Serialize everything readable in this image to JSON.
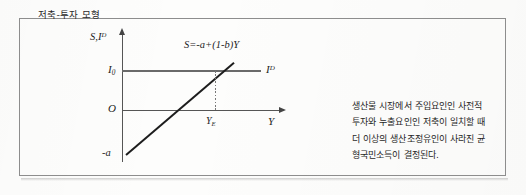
{
  "figure": {
    "caption": "저축-투자 모형"
  },
  "chart_data": {
    "type": "line",
    "title": "저축-투자 모형",
    "xlabel": "Y",
    "ylabel": "S,I",
    "ylabel_full": "S,I D",
    "grid": false,
    "legend": "inline-labels",
    "axis_labels": {
      "y_axis": "S,I",
      "y_axis_superscript": "D",
      "x_axis": "Y",
      "origin": "O"
    },
    "tick_labels": {
      "y_investment": "I",
      "y_investment_subscript": "0",
      "x_equilibrium": "Y",
      "x_equilibrium_subscript": "E",
      "y_intercept": "-a"
    },
    "series": [
      {
        "name": "S=-a+(1-b)Y",
        "label": "S=-a+(1-b)Y",
        "type": "line",
        "style": "solid-black",
        "description": "Saving function, upward sloping, intercept -a",
        "points": [
          [
            0,
            -1
          ],
          [
            1,
            1.6
          ]
        ]
      },
      {
        "name": "I",
        "label": "I",
        "label_superscript": "D",
        "type": "line",
        "style": "solid-grey-horizontal",
        "description": "Autonomous investment demand, horizontal at I0",
        "points": [
          [
            0,
            0.5
          ],
          [
            1,
            0.5
          ]
        ]
      }
    ],
    "annotations": [
      {
        "name": "equilibrium-drop-line",
        "style": "dotted",
        "description": "Vertical dotted line from S and I intersection down to YE on the horizontal axis"
      }
    ]
  },
  "note": {
    "lines": [
      "생산물 시장에서 주입요인인 사전적",
      "투자와 누출요인인 저축이 일치할 때",
      "더 이상의 생산조정유인이 사라진 균",
      "형국민소득이 결정된다."
    ],
    "text": "생산물 시장에서 주입요인인 사전적 투자와 누출요인인 저축이 일치할 때 더 이상의 생산조정유인이 사라진 균형국민소득이 결정된다."
  },
  "colors": {
    "frame": "#8d8d8d",
    "axis": "#555555",
    "saving_line": "#1d1d1d",
    "investment_line": "#6a6a6a",
    "text": "#1f1f1f",
    "background": "#fdfdfc"
  }
}
